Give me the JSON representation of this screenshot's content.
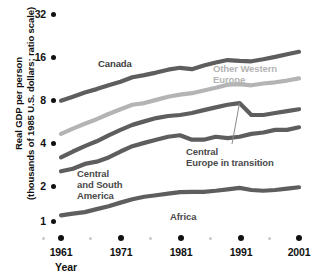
{
  "chart_data": {
    "type": "line",
    "title": "",
    "xlabel": "Year",
    "ylabel": "Real GDP per person (thousands of 1985 U.S. dollars; ratio scale)",
    "ylabel_line1": "Real GDP per person",
    "ylabel_line2": "(thousands of 1985 U.S. dollars; ratio scale)",
    "scale": "log2",
    "grid": false,
    "legend_position": "inline-annotations",
    "ylim": [
      1,
      32
    ],
    "xlim": [
      1961,
      2001
    ],
    "yticks": [
      32,
      16,
      8,
      4,
      2,
      1
    ],
    "ytick_labels": [
      "32",
      "16",
      "8",
      "4",
      "2",
      "1"
    ],
    "xticks": [
      1961,
      1971,
      1981,
      1991,
      2001
    ],
    "xtick_labels": [
      "1961",
      "1971",
      "1981",
      "1991",
      "2001"
    ],
    "x": [
      1961,
      1963,
      1965,
      1967,
      1969,
      1971,
      1973,
      1975,
      1977,
      1979,
      1981,
      1983,
      1985,
      1987,
      1989,
      1991,
      1993,
      1995,
      1997,
      1999,
      2001
    ],
    "series": [
      {
        "name": "Canada",
        "color": "#5e5e5e",
        "values": [
          7.5,
          8.0,
          8.6,
          9.1,
          9.7,
          10.3,
          11.1,
          11.5,
          12.0,
          12.6,
          13.0,
          12.7,
          13.5,
          14.2,
          14.8,
          14.6,
          14.5,
          15.0,
          15.6,
          16.3,
          17.0
        ]
      },
      {
        "name": "Other Western Europe",
        "color": "#b4b4b4",
        "values": [
          4.3,
          4.7,
          5.1,
          5.5,
          6.0,
          6.5,
          7.0,
          7.2,
          7.6,
          8.0,
          8.3,
          8.5,
          8.9,
          9.3,
          9.8,
          9.9,
          9.7,
          10.0,
          10.2,
          10.5,
          10.9
        ]
      },
      {
        "name": "Central Europe in transition",
        "color": "#5e5e5e",
        "values": [
          2.9,
          3.2,
          3.5,
          3.8,
          4.2,
          4.6,
          5.0,
          5.3,
          5.6,
          5.8,
          5.9,
          6.1,
          6.4,
          6.7,
          7.0,
          7.2,
          5.9,
          5.9,
          6.1,
          6.3,
          6.5
        ]
      },
      {
        "name": "Central and South America",
        "color": "#5e5e5e",
        "values": [
          2.3,
          2.4,
          2.6,
          2.7,
          2.9,
          3.2,
          3.5,
          3.7,
          3.9,
          4.1,
          4.2,
          3.9,
          3.9,
          4.1,
          4.0,
          4.1,
          4.3,
          4.4,
          4.6,
          4.6,
          4.8
        ]
      },
      {
        "name": "Africa",
        "color": "#5e5e5e",
        "values": [
          1.1,
          1.13,
          1.16,
          1.22,
          1.28,
          1.36,
          1.44,
          1.5,
          1.54,
          1.58,
          1.62,
          1.63,
          1.63,
          1.66,
          1.7,
          1.74,
          1.68,
          1.66,
          1.68,
          1.72,
          1.76
        ]
      }
    ],
    "annotations": [
      {
        "text": "Canada",
        "series": "Canada"
      },
      {
        "text_line1": "Other Western",
        "text_line2": "Europe",
        "series": "Other Western Europe"
      },
      {
        "text_line1": "Central",
        "text_line2": "Europe in transition",
        "series": "Central Europe in transition",
        "has_leader_line": true
      },
      {
        "text_line1": "Central",
        "text_line2": "and South",
        "text_line3": "America",
        "series": "Central and South America"
      },
      {
        "text": "Africa",
        "series": "Africa"
      }
    ]
  }
}
